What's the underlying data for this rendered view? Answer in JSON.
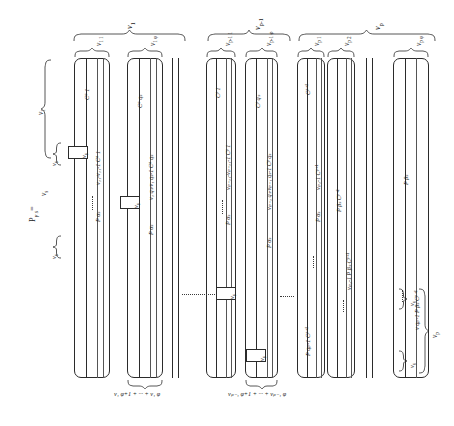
{
  "figure": {
    "equation_label": "P",
    "equation_sub": "γ s",
    "equation_eq": "=",
    "top_braces": [
      {
        "name": "nu-1",
        "label": "ν",
        "sub": "1"
      },
      {
        "name": "nu-p-minus-1",
        "label": "ν",
        "sub": "p-1"
      },
      {
        "name": "nu-p",
        "label": "ν",
        "sub": "p"
      }
    ],
    "sub_braces": [
      {
        "name": "nu-1-1",
        "label": "ν",
        "sub": "1 1"
      },
      {
        "name": "nu-1-phi",
        "label": "ν",
        "sub": "1 φ"
      },
      {
        "name": "nu-p-1-1",
        "label": "ν",
        "sub": "p-1 1"
      },
      {
        "name": "nu-p-1-phi",
        "label": "ν",
        "sub": "p-1 φ"
      },
      {
        "name": "nu-p-1-col",
        "label": "ν",
        "sub": "p 1"
      },
      {
        "name": "nu-p-2-col",
        "label": "ν",
        "sub": "p 2"
      },
      {
        "name": "nu-p-phi",
        "label": "ν",
        "sub": "p φ"
      }
    ],
    "left_braces": [
      {
        "name": "left-brace-nu-1",
        "label": "ν",
        "sub": "1"
      },
      {
        "name": "left-brace-nu-s-upper",
        "label": "ν",
        "sub": "s"
      },
      {
        "name": "left-brace-nu-s-mid",
        "label": "ν",
        "sub": "s"
      },
      {
        "name": "left-brace-nu-s-lower",
        "label": "ν",
        "sub": "s"
      }
    ],
    "right_braces": [
      {
        "name": "right-brace-nu-s-upper",
        "label": "ν",
        "sub": "s"
      },
      {
        "name": "right-brace-nu-p",
        "label": "ν",
        "sub": "p"
      },
      {
        "name": "right-brace-nu-s-lower",
        "label": "ν",
        "sub": "s"
      }
    ],
    "bottom_braces": [
      {
        "name": "bottom-brace-block-1",
        "label": "ν₁ φ+1 + ··· + ν₁ φ"
      },
      {
        "name": "bottom-brace-block-p-1",
        "label": "νₚ₋₁ φ+1 + ··· + νₚ₋₁ φ"
      }
    ],
    "nu_boxes": [
      {
        "name": "nu-box-1",
        "label": "ν",
        "sub": "s"
      },
      {
        "name": "nu-box-2",
        "label": "ν",
        "sub": "s"
      },
      {
        "name": "nu-box-3",
        "label": "ν",
        "sub": "s"
      },
      {
        "name": "nu-box-4",
        "label": "ν",
        "sub": "s"
      }
    ],
    "column_labels": {
      "block1": [
        {
          "name": "label-C-a-1",
          "text": "Cᵃ 1"
        },
        {
          "name": "label-nu11-minus-1-C-a-1",
          "text": "ν₁₁-ν₁₁-1 Cᵃ 1"
        },
        {
          "name": "label-P-alpha-s-b1",
          "text": "P αₛ"
        },
        {
          "name": "label-C-a-q-s",
          "text": "Cᵃ qₛ"
        },
        {
          "name": "label-nu1qs-minus-1-C-a-qs",
          "text": "ν₁ qₛ-ν₁ qₛ-1 Cᵃ qₛ"
        },
        {
          "name": "label-P-alpha-s-b1b",
          "text": "P αₛ"
        }
      ],
      "block_p_minus_1": [
        {
          "name": "label-C-p-1",
          "text": "Cᵖ 1"
        },
        {
          "name": "label-nup11-C-p-1",
          "text": "νₚ₋₁₁-νₚ₋₁₁-1 Cᵖ 1"
        },
        {
          "name": "label-P-alpha-s-bp1",
          "text": "P αₛ"
        },
        {
          "name": "label-C-p-q-s",
          "text": "Cᵖ qₛ"
        },
        {
          "name": "label-nup1qs-C-p-qs",
          "text": "νₚ₋₁ qₛ-νₚ₋₁ qₛ-1 Cᵖ qₛ"
        },
        {
          "name": "label-P-alpha-s-bp1b",
          "text": "P αₛ"
        }
      ],
      "block_p": [
        {
          "name": "label-C-p-plus-1",
          "text": "Cᵖ⁺¹"
        },
        {
          "name": "label-nup1-minus-1-C-p-plus-1",
          "text": "νₚ₁-1 Cᵖ⁺¹"
        },
        {
          "name": "label-P-alpha-s-bp",
          "text": "P αₛ"
        },
        {
          "name": "label-P-beta-s-C-p-plus-1",
          "text": "P βₛ Cᵖ⁺¹"
        },
        {
          "name": "label-nup1-minus-1-P-beta-s",
          "text": "νₚ₁-1 P βₛ Cᵖ⁺¹"
        },
        {
          "name": "label-P-beta-s-qs-minus-1",
          "text": "P qₚ-1 Cᵖ⁺¹"
        },
        {
          "name": "label-P-beta-s-right",
          "text": "P βₛ"
        },
        {
          "name": "label-C-p-plus-1-right",
          "text": "Cᵖ⁺¹"
        },
        {
          "name": "label-nu-q-p-minus-1-P-beta",
          "text": "ν qₚ-1 P βₛ Cᵖ⁺¹"
        },
        {
          "name": "label-P-alpha-s-far",
          "text": "P αₛ"
        }
      ]
    }
  }
}
